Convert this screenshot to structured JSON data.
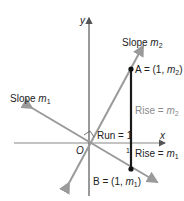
{
  "diagram": {
    "axes": {
      "x_label": "x",
      "y_label": "y",
      "origin_label": "O"
    },
    "lines": [
      {
        "name": "Slope",
        "var": "m",
        "sub": "2"
      },
      {
        "name": "Slope",
        "var": "m",
        "sub": "1"
      }
    ],
    "points": {
      "A": {
        "prefix": "A = (1, ",
        "var": "m",
        "sub": "2",
        "suffix": ")"
      },
      "B": {
        "prefix": "B = (1, ",
        "var": "m",
        "sub": "1",
        "suffix": ")"
      }
    },
    "run_label": "Run = 1",
    "tick_label": "1",
    "rise2": {
      "prefix": "Rise = ",
      "var": "m",
      "sub": "2"
    },
    "rise1": {
      "prefix": "Rise = ",
      "var": "m",
      "sub": "1"
    },
    "colors": {
      "line": "#9a9a9a",
      "axis": "#555555",
      "segment": "#1a1a1a",
      "text": "#222222"
    }
  }
}
